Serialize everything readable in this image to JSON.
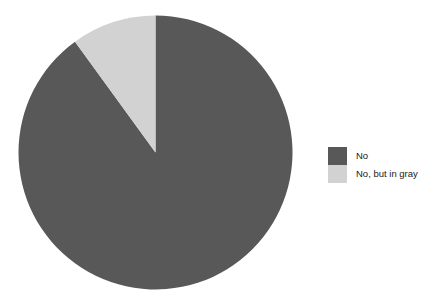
{
  "background_color": "#ffffff",
  "chart_data": {
    "type": "pie",
    "title": "",
    "subtitle": "",
    "xlabel": "",
    "ylabel": "",
    "grid": false,
    "legend_position": "right",
    "start_angle_deg": 0,
    "direction": "clockwise",
    "categories": [
      "No",
      "No, but in gray"
    ],
    "values": [
      90,
      10
    ],
    "value_unit": "percent",
    "colors": [
      "#585858",
      "#d2d2d2"
    ],
    "slices": [
      {
        "label": "No",
        "value": 90,
        "percent": 90,
        "sweep_deg": 324,
        "color": "#585858"
      },
      {
        "label": "No, but in gray",
        "value": 10,
        "percent": 10,
        "sweep_deg": 36,
        "color": "#d2d2d2"
      }
    ],
    "geometry": {
      "center_x": 155.5,
      "center_y": 152.5,
      "radius": 137
    }
  },
  "legend": {
    "items": [
      {
        "label": "No",
        "color": "#585858"
      },
      {
        "label": "No, but in gray",
        "color": "#d2d2d2"
      }
    ]
  }
}
